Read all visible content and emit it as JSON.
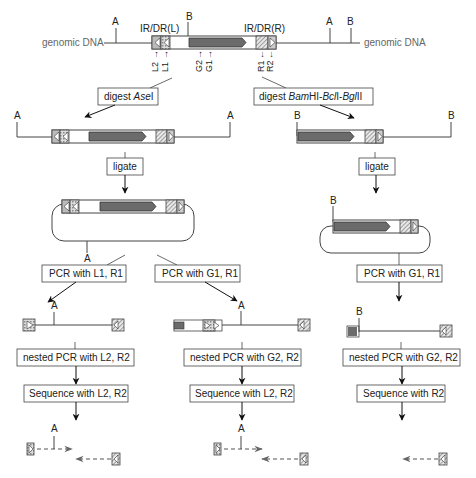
{
  "diagram": {
    "genomic": {
      "left_label": "genomic DNA",
      "right_label": "genomic DNA",
      "site_A": "A",
      "site_B": "B",
      "ir_left": "IR/DR(L)",
      "ir_right": "IR/DR(R)",
      "primers": {
        "L2": "L2",
        "L1": "L1",
        "G2": "G2",
        "G1": "G1",
        "R1": "R1",
        "R2": "R2"
      },
      "arrow_left": "←",
      "arrow_right": "→"
    },
    "left_branch": {
      "digest_label_prefix": "digest ",
      "digest_enzyme": "Ase",
      "digest_suffix": "I",
      "site_A": "A",
      "ligate_label": "ligate",
      "circle_site": "A"
    },
    "right_branch": {
      "digest_label_prefix": "digest ",
      "digest_enzyme_1": "Bam",
      "digest_mid_1": "HI-",
      "digest_enzyme_2": "Bcl",
      "digest_mid_2": "I-",
      "digest_enzyme_3": "Bgl",
      "digest_suffix": "II",
      "site_B": "B",
      "ligate_label": "ligate",
      "circle_site": "B",
      "pcr_label": "PCR with G1, R1",
      "product_site": "B",
      "nested_label": "nested PCR with G2, R2",
      "sequence_label": "Sequence with R2"
    },
    "column1": {
      "pcr_label": "PCR with L1, R1",
      "product_site": "A",
      "nested_label": "nested PCR with L2, R2",
      "sequence_label": "Sequence with L2, R2",
      "result_site": "A"
    },
    "column2": {
      "pcr_label": "PCR with G1, R1",
      "product_site": "A",
      "nested_label": "nested PCR with G2, R2",
      "sequence_label": "Sequence with L2, R2",
      "result_site": "A"
    },
    "colors": {
      "line": "#444444",
      "gene": "#6b6b6b",
      "ir_fill": "#bdbdbd",
      "grey_text": "#666666",
      "dashed_arrow": "#555555"
    }
  }
}
